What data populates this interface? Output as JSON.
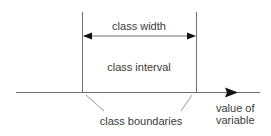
{
  "diagram": {
    "labels": {
      "class_width": "class width",
      "class_interval": "class interval",
      "class_boundaries": "class boundaries",
      "value_of": "value of",
      "variable": "variable"
    },
    "colors": {
      "line": "#6e6e6e",
      "arrow": "#111111",
      "leader": "#9a9a9a",
      "text": "#3a3a3a",
      "background": "#ffffff"
    }
  }
}
